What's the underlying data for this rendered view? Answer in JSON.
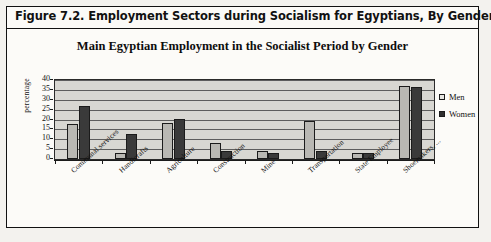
{
  "figure": {
    "caption": "Figure 7.2.  Employment Sectors during Socialism for Egyptians, By Gender"
  },
  "chart_data": {
    "type": "bar",
    "title": "Main Egyptian Employment in the Socialist Period by Gender",
    "xlabel": "",
    "ylabel": "percentage",
    "ylim": [
      0,
      40
    ],
    "yticks": [
      0,
      5,
      10,
      15,
      20,
      25,
      30,
      35,
      40
    ],
    "grid": true,
    "legend_position": "right",
    "categories": [
      "Communal services",
      "Handicrafts",
      "Agriculture",
      "Construction",
      "Mine",
      "Transportation",
      "State Employee",
      "Shoemakers, ..."
    ],
    "series": [
      {
        "name": "Men",
        "color": "#b9b8b3",
        "values": [
          17.5,
          3,
          18,
          8,
          4,
          19.5,
          3,
          37
        ]
      },
      {
        "name": "Women",
        "color": "#3a3a3a",
        "values": [
          27,
          12.5,
          20.5,
          4,
          3,
          4,
          3,
          36.5
        ]
      }
    ]
  }
}
